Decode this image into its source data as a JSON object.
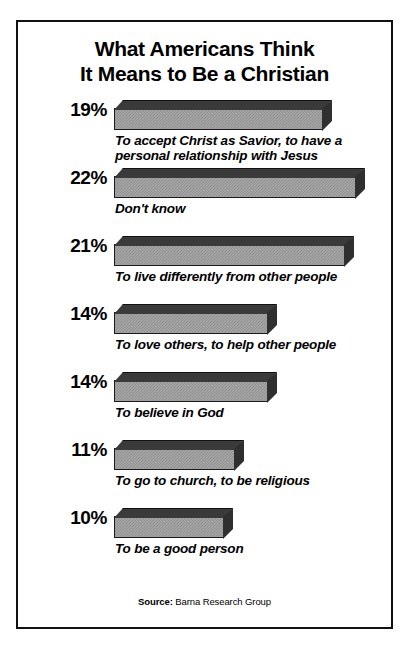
{
  "chart_data": {
    "type": "bar",
    "title": "What Americans Think It Means to Be a Christian",
    "title_lines": [
      "What Americans Think",
      "It Means to Be a Christian"
    ],
    "orientation": "horizontal",
    "xlabel": "",
    "ylabel": "",
    "grid": false,
    "legend": null,
    "value_suffix": "%",
    "xlim": [
      0,
      22
    ],
    "categories": [
      "To accept Christ as Savior, to have a personal relationship with Jesus",
      "Don't know",
      "To live differently from other people",
      "To love others, to help other people",
      "To believe in God",
      "To go to church, to be religious",
      "To be a good person"
    ],
    "values": [
      19,
      22,
      21,
      14,
      14,
      11,
      10
    ],
    "value_labels": [
      "19%",
      "22%",
      "21%",
      "14%",
      "14%",
      "11%",
      "10%"
    ],
    "bars": [
      {
        "value_label": "19%",
        "value": 19,
        "label": "To accept Christ as Savior, to have a\npersonal relationship with Jesus"
      },
      {
        "value_label": "22%",
        "value": 22,
        "label": "Don't know"
      },
      {
        "value_label": "21%",
        "value": 21,
        "label": "To live differently from other people"
      },
      {
        "value_label": "14%",
        "value": 14,
        "label": "To love others, to help other people"
      },
      {
        "value_label": "14%",
        "value": 14,
        "label": "To believe in God"
      },
      {
        "value_label": "11%",
        "value": 11,
        "label": "To go to church, to be religious"
      },
      {
        "value_label": "10%",
        "value": 10,
        "label": "To be a good person"
      }
    ],
    "source_label": "Source:",
    "source_text": " Barna Research Group",
    "colors": {
      "bar_front": "#a6a6a6",
      "bar_top": "#3a3a3a",
      "bar_cap": "#2f2f2f",
      "outline": "#1a1a1a",
      "text": "#000000",
      "background": "#ffffff"
    }
  }
}
